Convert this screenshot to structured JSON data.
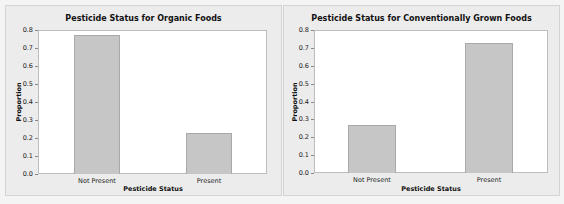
{
  "chart_data": [
    {
      "type": "bar",
      "title": "Pesticide Status for Organic Foods",
      "xlabel": "Pesticide Status",
      "ylabel": "Proportion",
      "categories": [
        "Not Present",
        "Present"
      ],
      "values": [
        0.77,
        0.23
      ],
      "ylim": [
        0,
        0.8
      ],
      "yticks": [
        "0.0",
        "0.1",
        "0.2",
        "0.3",
        "0.4",
        "0.5",
        "0.6",
        "0.7",
        "0.8"
      ],
      "grid": false,
      "legend": null,
      "bar_color": "#c6c6c6"
    },
    {
      "type": "bar",
      "title": "Pesticide Status for Conventionally Grown Foods",
      "xlabel": "Pesticide Status",
      "ylabel": "Proportion",
      "categories": [
        "Not Present",
        "Present"
      ],
      "values": [
        0.27,
        0.73
      ],
      "ylim": [
        0,
        0.8
      ],
      "yticks": [
        "0.0",
        "0.1",
        "0.2",
        "0.3",
        "0.4",
        "0.5",
        "0.6",
        "0.7",
        "0.8"
      ],
      "grid": false,
      "legend": null,
      "bar_color": "#c6c6c6"
    }
  ]
}
